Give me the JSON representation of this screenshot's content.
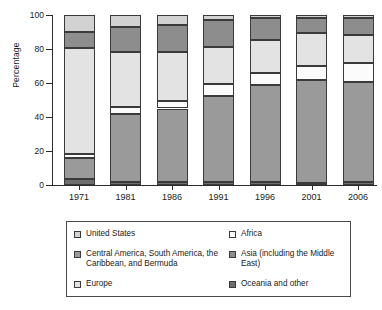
{
  "chart_data": {
    "type": "bar",
    "stacked": true,
    "title": "",
    "xlabel": "",
    "ylabel": "Percentage",
    "ylim": [
      0,
      100
    ],
    "yticks": [
      0,
      20,
      40,
      60,
      80,
      100
    ],
    "grid": false,
    "legend_position": "bottom",
    "categories": [
      "1971",
      "1981",
      "1986",
      "1991",
      "1996",
      "2001",
      "2006"
    ],
    "series": [
      {
        "name": "Oceania and other",
        "color": "#6e6e6e",
        "values": [
          3.5,
          2.0,
          1.5,
          1.5,
          1.5,
          1.0,
          1.5
        ]
      },
      {
        "name": "Central America, South America, the Caribbean, and Bermuda",
        "color": "#9a9a9a",
        "values": [
          12.5,
          39.5,
          43.5,
          51.0,
          57.5,
          60.5,
          59.0
        ]
      },
      {
        "name": "Africa",
        "color": "#fbfbfb",
        "values": [
          2.5,
          4.5,
          4.5,
          7.0,
          7.0,
          8.5,
          11.0
        ]
      },
      {
        "name": "Europe",
        "color": "#e3e3e3",
        "values": [
          62.0,
          32.0,
          29.0,
          21.5,
          19.5,
          19.5,
          16.5
        ]
      },
      {
        "name": "Asia (including the Middle East)",
        "color": "#8d8d8d",
        "values": [
          9.5,
          15.0,
          15.5,
          16.0,
          13.0,
          8.5,
          10.0
        ]
      },
      {
        "name": "United States",
        "color": "#d2d2d2",
        "values": [
          10.0,
          7.0,
          6.0,
          3.0,
          1.5,
          2.0,
          2.0
        ]
      }
    ]
  },
  "legend": {
    "columns": [
      {
        "items": [
          {
            "label": "United States",
            "color": "#d2d2d2"
          },
          {
            "label": "Central America, South America, the Caribbean, and Bermuda",
            "color": "#9a9a9a"
          },
          {
            "label": "Europe",
            "color": "#e3e3e3"
          }
        ]
      },
      {
        "items": [
          {
            "label": "Africa",
            "color": "#fbfbfb"
          },
          {
            "label": "Asia (including the Middle East)",
            "color": "#8d8d8d"
          },
          {
            "label": "Oceania and other",
            "color": "#6e6e6e"
          }
        ]
      }
    ]
  },
  "axes": {
    "y_label": "Percentage",
    "y_tick_labels": [
      "0",
      "20",
      "40",
      "60",
      "80",
      "100"
    ],
    "x_tick_labels": [
      "1971",
      "1981",
      "1986",
      "1991",
      "1996",
      "2001",
      "2006"
    ]
  }
}
